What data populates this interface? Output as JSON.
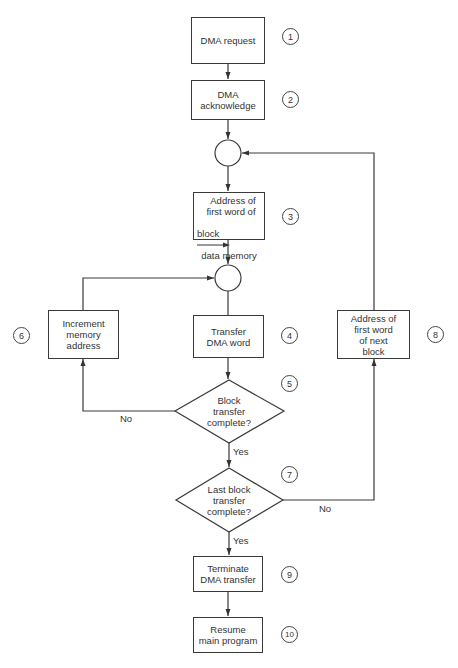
{
  "diagram": {
    "type": "flowchart",
    "nodes": [
      {
        "id": "dma_request",
        "shape": "rect",
        "label": "DMA request",
        "step": "1"
      },
      {
        "id": "dma_ack",
        "shape": "rect",
        "label": "DMA\nacknowledge",
        "step": "2"
      },
      {
        "id": "junction_1",
        "shape": "circle",
        "label": ""
      },
      {
        "id": "addr_first_word",
        "shape": "rect",
        "label": "Address of\nfirst word of\nblock → data memory",
        "step": "3"
      },
      {
        "id": "junction_2",
        "shape": "circle",
        "label": ""
      },
      {
        "id": "transfer_word",
        "shape": "rect",
        "label": "Transfer\nDMA word",
        "step": "4"
      },
      {
        "id": "block_complete",
        "shape": "diamond",
        "label": "Block\ntransfer\ncomplete?",
        "step": "5"
      },
      {
        "id": "increment_addr",
        "shape": "rect",
        "label": "Increment\nmemory\naddress",
        "step": "6"
      },
      {
        "id": "last_block_complete",
        "shape": "diamond",
        "label": "Last block\ntransfer\ncomplete?",
        "step": "7"
      },
      {
        "id": "addr_next_block",
        "shape": "rect",
        "label": "Address of\nfirst word\nof next\nblock",
        "step": "8"
      },
      {
        "id": "terminate",
        "shape": "rect",
        "label": "Terminate\nDMA transfer",
        "step": "9"
      },
      {
        "id": "resume",
        "shape": "rect",
        "label": "Resume\nmain program",
        "step": "10"
      }
    ],
    "edges": [
      {
        "from": "dma_request",
        "to": "dma_ack",
        "label": ""
      },
      {
        "from": "dma_ack",
        "to": "junction_1",
        "label": ""
      },
      {
        "from": "junction_1",
        "to": "addr_first_word",
        "label": ""
      },
      {
        "from": "addr_first_word",
        "to": "junction_2",
        "label": ""
      },
      {
        "from": "junction_2",
        "to": "transfer_word",
        "label": ""
      },
      {
        "from": "transfer_word",
        "to": "block_complete",
        "label": ""
      },
      {
        "from": "block_complete",
        "to": "increment_addr",
        "label": "No"
      },
      {
        "from": "increment_addr",
        "to": "junction_2",
        "label": ""
      },
      {
        "from": "block_complete",
        "to": "last_block_complete",
        "label": "Yes"
      },
      {
        "from": "last_block_complete",
        "to": "addr_next_block",
        "label": "No"
      },
      {
        "from": "addr_next_block",
        "to": "junction_1",
        "label": ""
      },
      {
        "from": "last_block_complete",
        "to": "terminate",
        "label": "Yes"
      },
      {
        "from": "terminate",
        "to": "resume",
        "label": ""
      }
    ]
  },
  "labels": {
    "dma_request": "DMA request",
    "dma_ack": "DMA\nacknowledge",
    "addr_first_line1": "Address of",
    "addr_first_line2": "first word of",
    "addr_first_line3": "block",
    "addr_first_line4": "data memory",
    "transfer_word": "Transfer\nDMA word",
    "block_complete": "Block\ntransfer\ncomplete?",
    "increment_addr": "Increment\nmemory\naddress",
    "last_block_complete": "Last block\ntransfer\ncomplete?",
    "addr_next_block": "Address of\nfirst word\nof next\nblock",
    "terminate": "Terminate\nDMA transfer",
    "resume": "Resume\nmain program"
  },
  "steps": [
    "1",
    "2",
    "3",
    "4",
    "5",
    "6",
    "7",
    "8",
    "9",
    "10"
  ],
  "edge_labels": {
    "block_no": "No",
    "block_yes": "Yes",
    "last_no": "No",
    "last_yes": "Yes"
  }
}
